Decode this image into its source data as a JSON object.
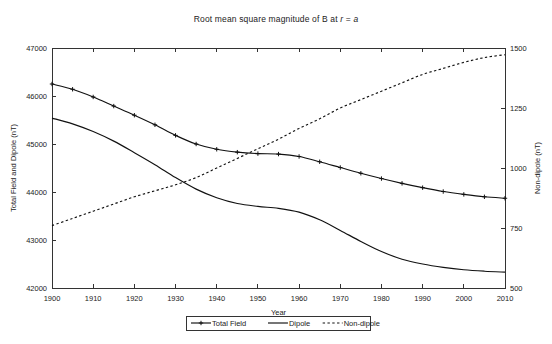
{
  "chart_data": {
    "type": "line",
    "title": "Root mean square magnitude of B at r = a",
    "title_parts": {
      "prefix": "Root mean square magnitude of B at ",
      "var1": "r",
      "middle": " = ",
      "var2": "a"
    },
    "xlabel": "Year",
    "ylabel_left": "Total Field and Dipole (nT)",
    "ylabel_right": "Non-dipole (nT)",
    "grid": false,
    "legend_position": "bottom-center",
    "xlim": [
      1900,
      2010
    ],
    "xticks": [
      1900,
      1910,
      1920,
      1930,
      1940,
      1950,
      1960,
      1970,
      1980,
      1990,
      2000,
      2010
    ],
    "ylim_left": [
      42000,
      47000
    ],
    "yticks_left": [
      42000,
      43000,
      44000,
      45000,
      46000,
      47000
    ],
    "ylim_right": [
      500,
      1500
    ],
    "yticks_right": [
      500,
      750,
      1000,
      1250,
      1500
    ],
    "x": [
      1900,
      1905,
      1910,
      1915,
      1920,
      1925,
      1930,
      1935,
      1940,
      1945,
      1950,
      1955,
      1960,
      1965,
      1970,
      1975,
      1980,
      1985,
      1990,
      1995,
      2000,
      2005,
      2010
    ],
    "series": [
      {
        "name": "Total Field",
        "axis": "left",
        "style": "solid-markers",
        "marker": "plus",
        "values": [
          46250,
          46140,
          45980,
          45790,
          45600,
          45400,
          45180,
          45000,
          44890,
          44830,
          44800,
          44790,
          44740,
          44630,
          44510,
          44390,
          44280,
          44180,
          44090,
          44010,
          43950,
          43900,
          43870
        ]
      },
      {
        "name": "Dipole",
        "axis": "left",
        "style": "solid",
        "values": [
          45540,
          45420,
          45260,
          45060,
          44820,
          44570,
          44300,
          44060,
          43880,
          43760,
          43700,
          43660,
          43580,
          43420,
          43200,
          42970,
          42760,
          42600,
          42500,
          42430,
          42380,
          42350,
          42330
        ]
      },
      {
        "name": "Non-dipole",
        "axis": "right",
        "style": "dashed",
        "values": [
          760,
          790,
          820,
          850,
          880,
          905,
          930,
          960,
          1000,
          1040,
          1080,
          1120,
          1165,
          1205,
          1250,
          1285,
          1320,
          1355,
          1390,
          1415,
          1440,
          1460,
          1472
        ]
      }
    ],
    "legend": [
      {
        "label": "Total Field",
        "style": "solid-markers"
      },
      {
        "label": "Dipole",
        "style": "solid"
      },
      {
        "label": "Non-dipole",
        "style": "dashed"
      }
    ],
    "colors": {
      "series": "#111111",
      "axis": "#333333",
      "background": "#ffffff"
    }
  }
}
